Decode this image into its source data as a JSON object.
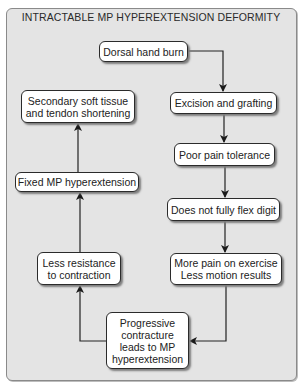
{
  "title": "INTRACTABLE MP HYPEREXTENSION DEFORMITY",
  "nodes": {
    "dorsal": "Dorsal hand burn",
    "excision": "Excision and grafting",
    "poor_pain": "Poor pain tolerance",
    "not_flex": "Does not fully flex digit",
    "more_pain": "More pain on exercise\nLess motion results",
    "progressive": "Progressive\ncontracture\nleads to MP\nhyperextension",
    "less_resistance": "Less resistance\nto contraction",
    "fixed_mp": "Fixed MP hyperextension",
    "secondary": "Secondary soft tissue\nand tendon shortening"
  },
  "colors": {
    "panel": "#e4e4e4",
    "box": "#ffffff",
    "line": "#222222"
  }
}
